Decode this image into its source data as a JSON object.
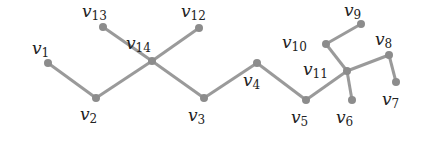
{
  "diagram": {
    "type": "tree",
    "edge_color": "#9a9a9a",
    "node_color": "#8c8c8c",
    "nodes": [
      {
        "id": "v1",
        "letter": "v",
        "sub": "1",
        "x": 48,
        "y": 63,
        "lx": 32,
        "ly": 40
      },
      {
        "id": "v2",
        "letter": "v",
        "sub": "2",
        "x": 96,
        "y": 98,
        "lx": 80,
        "ly": 106
      },
      {
        "id": "v3",
        "letter": "v",
        "sub": "3",
        "x": 204,
        "y": 98,
        "lx": 188,
        "ly": 107
      },
      {
        "id": "v4",
        "letter": "v",
        "sub": "4",
        "x": 257,
        "y": 63,
        "lx": 243,
        "ly": 72
      },
      {
        "id": "v5",
        "letter": "v",
        "sub": "5",
        "x": 306,
        "y": 100,
        "lx": 291,
        "ly": 109
      },
      {
        "id": "v6",
        "letter": "v",
        "sub": "6",
        "x": 352,
        "y": 100,
        "lx": 336,
        "ly": 109
      },
      {
        "id": "v7",
        "letter": "v",
        "sub": "7",
        "x": 396,
        "y": 82,
        "lx": 382,
        "ly": 91
      },
      {
        "id": "v8",
        "letter": "v",
        "sub": "8",
        "x": 389,
        "y": 55,
        "lx": 375,
        "ly": 31
      },
      {
        "id": "v9",
        "letter": "v",
        "sub": "9",
        "x": 361,
        "y": 24,
        "lx": 344,
        "ly": 2
      },
      {
        "id": "v10",
        "letter": "v",
        "sub": "10",
        "x": 326,
        "y": 44,
        "lx": 282,
        "ly": 34
      },
      {
        "id": "v11",
        "letter": "v",
        "sub": "11",
        "x": 347,
        "y": 71,
        "lx": 303,
        "ly": 61
      },
      {
        "id": "v12",
        "letter": "v",
        "sub": "12",
        "x": 199,
        "y": 28,
        "lx": 181,
        "ly": 3
      },
      {
        "id": "v13",
        "letter": "v",
        "sub": "13",
        "x": 103,
        "y": 27,
        "lx": 82,
        "ly": 3
      },
      {
        "id": "v14",
        "letter": "v",
        "sub": "14",
        "x": 152,
        "y": 61,
        "lx": 126,
        "ly": 35
      }
    ],
    "edges": [
      [
        "v1",
        "v2"
      ],
      [
        "v2",
        "v14"
      ],
      [
        "v13",
        "v14"
      ],
      [
        "v14",
        "v12"
      ],
      [
        "v14",
        "v3"
      ],
      [
        "v3",
        "v4"
      ],
      [
        "v4",
        "v5"
      ],
      [
        "v5",
        "v11"
      ],
      [
        "v11",
        "v10"
      ],
      [
        "v10",
        "v9"
      ],
      [
        "v11",
        "v8"
      ],
      [
        "v8",
        "v7"
      ],
      [
        "v11",
        "v6"
      ]
    ]
  }
}
